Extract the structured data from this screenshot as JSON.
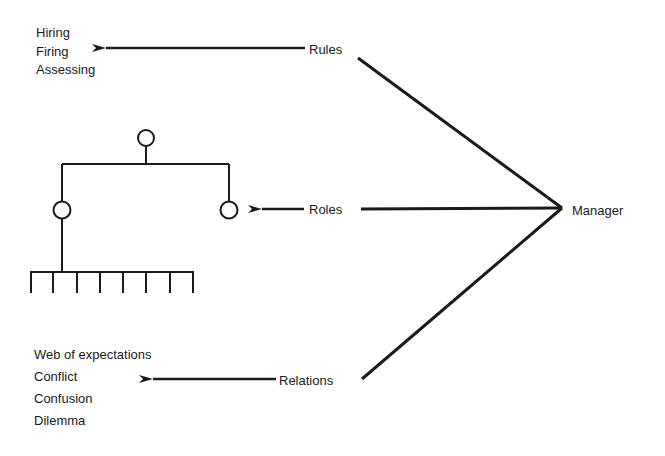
{
  "diagram": {
    "hub": {
      "label": "Manager"
    },
    "branches": [
      {
        "label": "Rules",
        "targets": [
          "Hiring",
          "Firing",
          "Assessing"
        ]
      },
      {
        "label": "Roles",
        "target": "organization-chart"
      },
      {
        "label": "Relations",
        "targets": [
          "Web of expectations",
          "Conflict",
          "Confusion",
          "Dilemma"
        ]
      }
    ],
    "org_chart": {
      "levels": 3,
      "bottom_units": 8
    },
    "colors": {
      "ink": "#1a1a1a",
      "background": "#ffffff"
    }
  }
}
